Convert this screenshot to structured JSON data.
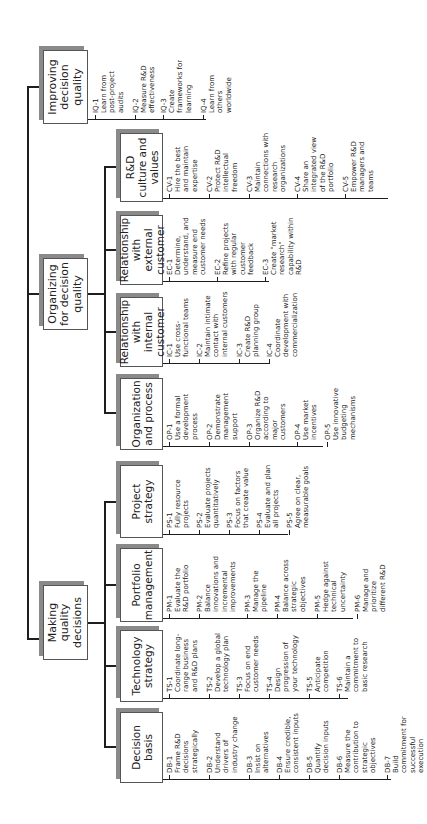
{
  "root": {
    "branches": [
      {
        "key": "iq",
        "label": "Improving decision quality",
        "items": [
          {
            "id": "IQ-1",
            "text": "Learn from\npost-project\naudits"
          },
          {
            "id": "IQ-2",
            "text": "Measure R&D\neffectiveness"
          },
          {
            "id": "IQ-3",
            "text": "Create\nframeworks for\nlearning"
          },
          {
            "id": "IQ-4",
            "text": "Learn from\nothers\nworldwide"
          }
        ]
      },
      {
        "key": "org",
        "label": "Organizing for decision quality",
        "children": [
          {
            "key": "cv",
            "label": "R&D culture and values",
            "items": [
              {
                "id": "CV-1",
                "text": "Hire the best\nand maintain\nexpertise"
              },
              {
                "id": "CV-2",
                "text": "Protect R&D\nintellectual\nfreedom"
              },
              {
                "id": "CV-3",
                "text": "Maintain\nconnections with\nresearch\norganizations"
              },
              {
                "id": "CV-4",
                "text": "Share an\nintegrated view\nof the R&D\nportfolio"
              },
              {
                "id": "CV-5",
                "text": "Empower R&D\nmanagers and\nteams"
              }
            ]
          },
          {
            "key": "ec",
            "label": "Relationship with external customer",
            "items": [
              {
                "id": "EC-1",
                "text": "Determine,\nunderstand, and\nmeasure end\ncustomer needs"
              },
              {
                "id": "EC-2",
                "text": "Refine projects\nwith regular\ncustomer\nfeedback"
              },
              {
                "id": "EC-3",
                "text": "Create \"market\nresearch\"\ncapability within\nR&D"
              }
            ]
          },
          {
            "key": "ic",
            "label": "Relationship with internal customer",
            "items": [
              {
                "id": "IC-1",
                "text": "Use cross-\nfunctional teams"
              },
              {
                "id": "IC-2",
                "text": "Maintain intimate\ncontact with\ninternal customers"
              },
              {
                "id": "IC-3",
                "text": "Create R&D\nplanning group"
              },
              {
                "id": "IC-4",
                "text": "Coordinate\ndevelopment with\ncommercialization"
              }
            ]
          },
          {
            "key": "op",
            "label": "Organization and process",
            "items": [
              {
                "id": "OP-1",
                "text": "Use a formal\ndevelopment\nprocess"
              },
              {
                "id": "OP-2",
                "text": "Demonstrate\nmanagement\nsupport"
              },
              {
                "id": "OP-3",
                "text": "Organize R&D\naccording to\nmajor\ncustomers"
              },
              {
                "id": "OP-4",
                "text": "Use market\nincentives"
              },
              {
                "id": "OP-5",
                "text": "Use innovative\nbudgeting\nmechanisms"
              }
            ]
          }
        ]
      },
      {
        "key": "mk",
        "label": "Making quality decisions",
        "children": [
          {
            "key": "ps",
            "label": "Project strategy",
            "items": [
              {
                "id": "PS-1",
                "text": "Fully resource\nprojects"
              },
              {
                "id": "PS-2",
                "text": "Evaluate projects\nquantitatively"
              },
              {
                "id": "PS-3",
                "text": "Focus on factors\nthat create value"
              },
              {
                "id": "PS-4",
                "text": "Evaluate and plan\nall projects"
              },
              {
                "id": "PS-5",
                "text": "Agree on clear,\nmeasurable goals"
              }
            ]
          },
          {
            "key": "pm",
            "label": "Portfolio management",
            "items": [
              {
                "id": "PM-1",
                "text": "Evaluate the\nR&D portfolio"
              },
              {
                "id": "PM-2",
                "text": "Balance\ninnovations and\nincremental\nimprovements"
              },
              {
                "id": "PM-3",
                "text": "Manage the\npipeline"
              },
              {
                "id": "PM-4",
                "text": "Balance across\nstrategic\nobjectives"
              },
              {
                "id": "PM-5",
                "text": "Hedge against\ntechnical\nuncertainty"
              },
              {
                "id": "PM-6",
                "text": "Manage and\nprioritize\ndifferent R&D"
              }
            ]
          },
          {
            "key": "ts",
            "label": "Technology strategy",
            "items": [
              {
                "id": "TS-1",
                "text": "Coordinate long-\nrange business\nand R&D plans"
              },
              {
                "id": "TS-2",
                "text": "Develop a global\ntechnology plan"
              },
              {
                "id": "TS-3",
                "text": "Focus on end\ncustomer needs"
              },
              {
                "id": "TS-4",
                "text": "Design\nprogression of\nyour technology"
              },
              {
                "id": "TS-5",
                "text": "Anticipate\ncompetition"
              },
              {
                "id": "TS-6",
                "text": "Maintain a\ncommitment to\nbasic research"
              }
            ]
          },
          {
            "key": "db",
            "label": "Decision basis",
            "items": [
              {
                "id": "DB-1",
                "text": "Frame R&D\ndecisions\nstrategically"
              },
              {
                "id": "DB-2",
                "text": "Understand\ndrivers of\nindustry change"
              },
              {
                "id": "DB-3",
                "text": "Insist on\nalternatives"
              },
              {
                "id": "DB-4",
                "text": "Ensure credible,\nconsistent inputs"
              },
              {
                "id": "DB-5",
                "text": "Quantify\ndecision inputs"
              },
              {
                "id": "DB-6",
                "text": "Measure the\ncontribution to\nstrategic\nobjectives"
              },
              {
                "id": "DB-7",
                "text": "Build\ncommitment for\nsuccessful\nexecution"
              }
            ]
          }
        ]
      }
    ]
  }
}
